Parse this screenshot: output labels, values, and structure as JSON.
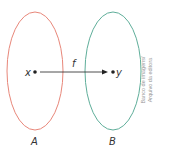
{
  "diagram": {
    "set_a": {
      "label": "A",
      "color": "#e8877a"
    },
    "set_b": {
      "label": "B",
      "color": "#5fae9a"
    },
    "element_x": "x",
    "element_y": "y",
    "function_label": "f",
    "credit_line1": "Banco de imagens/",
    "credit_line2": "Arquivo da editora"
  }
}
